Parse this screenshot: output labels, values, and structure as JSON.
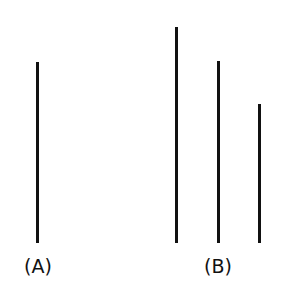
{
  "figure": {
    "caption_a": "(A)",
    "caption_b": "(B)",
    "line_color": "#111111",
    "group_a": {
      "lines": [
        {
          "x": 37,
          "top": 62,
          "bottom": 243
        }
      ]
    },
    "group_b": {
      "lines": [
        {
          "x": 176,
          "top": 27,
          "bottom": 243
        },
        {
          "x": 218,
          "top": 61,
          "bottom": 243
        },
        {
          "x": 259,
          "top": 104,
          "bottom": 243
        }
      ]
    }
  }
}
